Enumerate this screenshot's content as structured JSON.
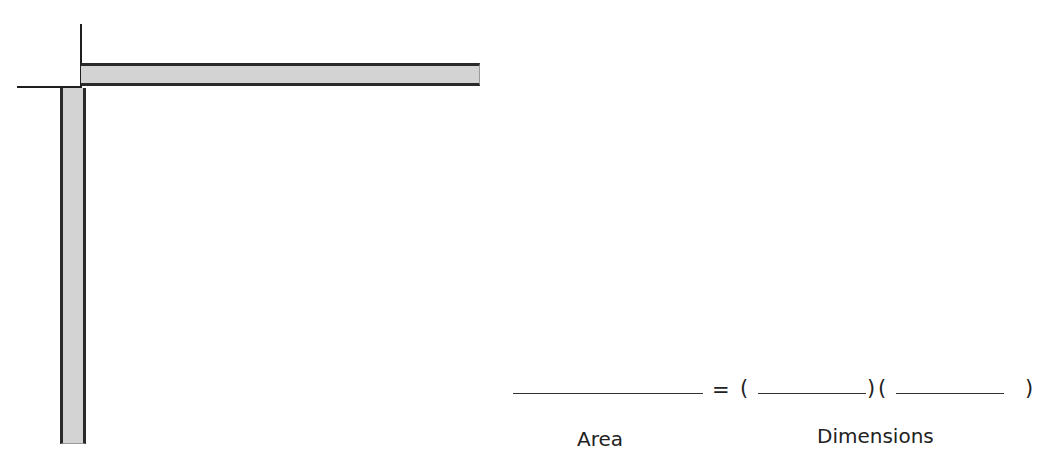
{
  "diagram": {
    "fill_color": "#d3d3d3",
    "border_color": "#2a2a2a"
  },
  "equation": {
    "equals": "=",
    "open_paren_1": "(",
    "close_paren_1": ")",
    "open_paren_2": "(",
    "close_paren_2": ")",
    "area_blank": "",
    "dimension_blank_1": "",
    "dimension_blank_2": "",
    "area_label": "Area",
    "dimensions_label": "Dimensions"
  }
}
